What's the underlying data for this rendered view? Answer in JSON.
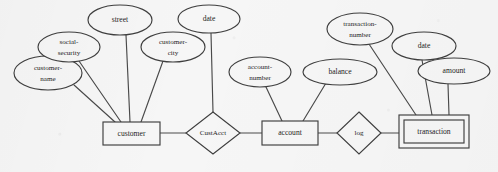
{
  "diagram": {
    "type": "er-diagram",
    "background_color": "#f6f6f6",
    "stroke_color": "#3f3f3f",
    "text_color": "#1d1d1d",
    "entities": [
      {
        "id": "customer",
        "label": "customer",
        "shape": "rectangle",
        "weak": false,
        "x": 103,
        "y": 122,
        "w": 57,
        "h": 23
      },
      {
        "id": "account",
        "label": "account",
        "shape": "rectangle",
        "weak": false,
        "x": 262,
        "y": 121,
        "w": 56,
        "h": 24
      },
      {
        "id": "transaction",
        "label": "transaction",
        "shape": "double-rectangle",
        "weak": true,
        "x": 399,
        "y": 115,
        "w": 70,
        "h": 33
      }
    ],
    "relationships": [
      {
        "id": "custacct",
        "label": "CustAcct",
        "shape": "diamond",
        "cx": 213,
        "cy": 133,
        "rx": 27,
        "ry": 21
      },
      {
        "id": "log",
        "label": "log",
        "shape": "diamond",
        "cx": 359,
        "cy": 133,
        "rx": 22,
        "ry": 21
      }
    ],
    "attributes": [
      {
        "id": "customer-name",
        "label": "customer-\nname",
        "line1": "customer-",
        "line2": "name",
        "owner": "customer",
        "cx": 48,
        "cy": 73,
        "rx": 34,
        "ry": 17
      },
      {
        "id": "social-security",
        "label": "social-\nsecurity",
        "line1": "social-",
        "line2": "security",
        "owner": "customer",
        "cx": 69,
        "cy": 47,
        "rx": 31,
        "ry": 15
      },
      {
        "id": "street",
        "label": "street",
        "line1": "street",
        "line2": "",
        "owner": "customer",
        "cx": 120,
        "cy": 20,
        "rx": 32,
        "ry": 15
      },
      {
        "id": "customer-city",
        "label": "customer-\ncity",
        "line1": "customer-",
        "line2": "city",
        "owner": "customer",
        "cx": 173,
        "cy": 47,
        "rx": 32,
        "ry": 15
      },
      {
        "id": "customer-date",
        "label": "date",
        "line1": "date",
        "line2": "",
        "owner": "custacct",
        "cx": 209,
        "cy": 19,
        "rx": 31,
        "ry": 14
      },
      {
        "id": "account-number",
        "label": "account-\nnumber",
        "line1": "account-",
        "line2": "number",
        "owner": "account",
        "cx": 260,
        "cy": 72,
        "rx": 31,
        "ry": 15
      },
      {
        "id": "balance",
        "label": "balance",
        "line1": "balance",
        "line2": "",
        "owner": "account",
        "cx": 340,
        "cy": 72,
        "rx": 37,
        "ry": 13
      },
      {
        "id": "transaction-number",
        "label": "transaction-\nnumber",
        "line1": "transaction-",
        "line2": "number",
        "owner": "transaction",
        "cx": 360,
        "cy": 29,
        "rx": 33,
        "ry": 16
      },
      {
        "id": "transaction-date",
        "label": "date",
        "line1": "date",
        "line2": "",
        "owner": "transaction",
        "cx": 424,
        "cy": 46,
        "rx": 32,
        "ry": 14
      },
      {
        "id": "amount",
        "label": "amount",
        "line1": "amount",
        "line2": "",
        "owner": "transaction",
        "cx": 454,
        "cy": 71,
        "rx": 36,
        "ry": 13
      }
    ],
    "edges": [
      {
        "id": "edge-customer-name",
        "from": "customer-name",
        "to": "customer",
        "x1": 74,
        "y1": 85,
        "x2": 115,
        "y2": 122
      },
      {
        "id": "edge-social-security",
        "from": "social-security",
        "to": "customer",
        "x1": 79,
        "y1": 61,
        "x2": 121,
        "y2": 122
      },
      {
        "id": "edge-street",
        "from": "street",
        "to": "customer",
        "x1": 126,
        "y1": 35,
        "x2": 130,
        "y2": 122
      },
      {
        "id": "edge-customer-city",
        "from": "customer-city",
        "to": "customer",
        "x1": 163,
        "y1": 61,
        "x2": 141,
        "y2": 122
      },
      {
        "id": "edge-date-custacct",
        "from": "customer-date",
        "to": "custacct",
        "x1": 211,
        "y1": 33,
        "x2": 213,
        "y2": 112
      },
      {
        "id": "edge-customer-custacct",
        "from": "customer",
        "to": "custacct",
        "x1": 160,
        "y1": 133,
        "x2": 186,
        "y2": 133
      },
      {
        "id": "edge-custacct-account",
        "from": "custacct",
        "to": "account",
        "x1": 240,
        "y1": 133,
        "x2": 262,
        "y2": 133
      },
      {
        "id": "edge-account-number",
        "from": "account-number",
        "to": "account",
        "x1": 266,
        "y1": 87,
        "x2": 282,
        "y2": 121
      },
      {
        "id": "edge-balance",
        "from": "balance",
        "to": "account",
        "x1": 326,
        "y1": 83,
        "x2": 303,
        "y2": 121
      },
      {
        "id": "edge-account-log",
        "from": "account",
        "to": "log",
        "x1": 318,
        "y1": 133,
        "x2": 337,
        "y2": 133
      },
      {
        "id": "edge-log-transaction",
        "from": "log",
        "to": "transaction",
        "x1": 381,
        "y1": 133,
        "x2": 399,
        "y2": 133
      },
      {
        "id": "edge-transaction-number",
        "from": "transaction-number",
        "to": "transaction",
        "x1": 369,
        "y1": 44,
        "x2": 416,
        "y2": 115
      },
      {
        "id": "edge-transaction-date",
        "from": "transaction-date",
        "to": "transaction",
        "x1": 422,
        "y1": 60,
        "x2": 432,
        "y2": 115
      },
      {
        "id": "edge-amount",
        "from": "amount",
        "to": "transaction",
        "x1": 448,
        "y1": 84,
        "x2": 449,
        "y2": 115
      }
    ]
  }
}
